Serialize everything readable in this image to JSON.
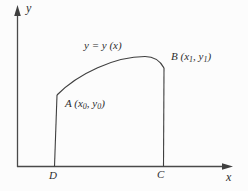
{
  "figure": {
    "background": "#fcfcfc",
    "line_color": "#3f3f3f",
    "axis": {
      "y_label": "y",
      "x_label": "x"
    },
    "curve_label": "y = y (x)",
    "points": {
      "a": {
        "prefix": "A (x",
        "sub1": "0",
        "mid": ", y",
        "sub2": "0",
        "suffix": ")"
      },
      "b": {
        "prefix": "B (x",
        "sub1": "1",
        "mid": ", y",
        "sub2": "1",
        "suffix": ")"
      },
      "d_label": "D",
      "c_label": "C"
    }
  }
}
